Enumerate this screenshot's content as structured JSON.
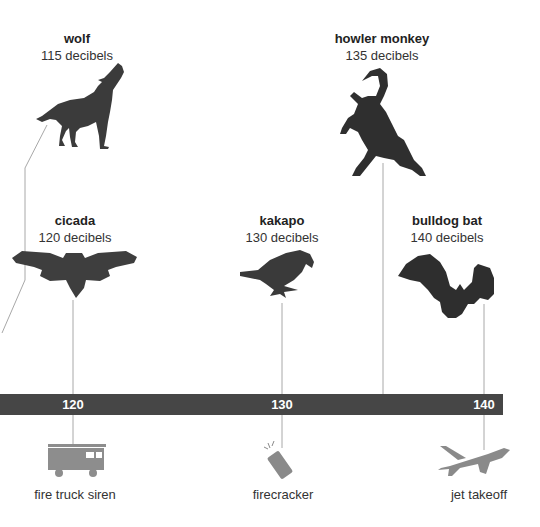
{
  "animals": [
    {
      "name": "wolf",
      "decibels": "115 decibels",
      "icon": "wolf-icon"
    },
    {
      "name": "cicada",
      "decibels": "120 decibels",
      "icon": "cicada-icon"
    },
    {
      "name": "kakapo",
      "decibels": "130 decibels",
      "icon": "kakapo-bird-icon"
    },
    {
      "name": "howler monkey",
      "decibels": "135 decibels",
      "icon": "howler-monkey-icon"
    },
    {
      "name": "bulldog bat",
      "decibels": "140 decibels",
      "icon": "bulldog-bat-icon"
    }
  ],
  "scale": {
    "ticks": [
      "120",
      "130",
      "140"
    ],
    "bar_color": "#464646",
    "silhouette_color": "#3a3a3a",
    "reference_icon_color": "#8a8a8a"
  },
  "references": [
    {
      "label": "fire truck siren",
      "icon": "fire-truck-icon",
      "value": "120"
    },
    {
      "label": "firecracker",
      "icon": "firecracker-icon",
      "value": "130"
    },
    {
      "label": "jet takeoff",
      "icon": "airplane-icon",
      "value": "140"
    }
  ]
}
